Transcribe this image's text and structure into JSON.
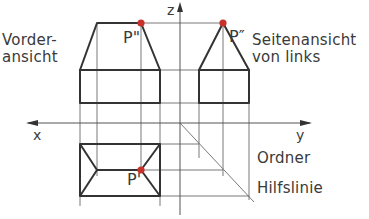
{
  "labels": {
    "front_view_line1": "Vorder-",
    "front_view_line2": "ansicht",
    "side_view_line1": "Seitenansicht",
    "side_view_line2": "von links",
    "point_front": "P\"",
    "point_side": "P″",
    "point_top": "P'",
    "axis_x": "x",
    "axis_y": "y",
    "axis_z": "z",
    "ordner": "Ordner",
    "hilfslinie": "Hilfslinie"
  },
  "colors": {
    "outline": "#333333",
    "construction": "#555555",
    "point": "#c8302c",
    "text": "#3a3a3a"
  }
}
